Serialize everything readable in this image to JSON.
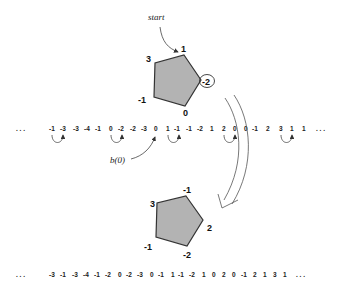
{
  "diagram": {
    "start_label": "start",
    "b0_label": "b(0)",
    "top_pentagon": {
      "vertices": [
        {
          "pos": "top",
          "value": "1"
        },
        {
          "pos": "right",
          "value": "-2",
          "circled": true
        },
        {
          "pos": "bottom-right",
          "value": "0"
        },
        {
          "pos": "bottom-left",
          "value": "-1"
        },
        {
          "pos": "upper-left",
          "value": "3"
        }
      ],
      "fill": "#b3b3b3",
      "stroke": "#333333"
    },
    "bottom_pentagon": {
      "vertices": [
        {
          "pos": "top",
          "value": "-1"
        },
        {
          "pos": "right",
          "value": "2"
        },
        {
          "pos": "bottom-right",
          "value": "-2"
        },
        {
          "pos": "bottom-left",
          "value": "-1"
        },
        {
          "pos": "upper-left",
          "value": "3"
        }
      ],
      "fill": "#b3b3b3",
      "stroke": "#333333"
    },
    "top_sequence": {
      "leading": ". . .",
      "values": [
        "-1",
        "-3",
        "-3",
        "-4",
        "-1",
        "0",
        "-2",
        "-2",
        "-3",
        "0",
        "1",
        "-1",
        "-1",
        "-2",
        "1",
        "2",
        "0",
        "0",
        "-1",
        "2",
        "3",
        "1",
        "1"
      ],
      "trailing": ". . .",
      "swap_pairs": [
        [
          0,
          1
        ],
        [
          5,
          6
        ],
        [
          10,
          11
        ],
        [
          15,
          16
        ],
        [
          20,
          21
        ]
      ]
    },
    "bottom_sequence": {
      "leading": ". . .",
      "values": [
        "-3",
        "-1",
        "-3",
        "-4",
        "-1",
        "-2",
        "0",
        "-2",
        "-3",
        "0",
        "-1",
        "1",
        "-1",
        "-2",
        "1",
        "0",
        "2",
        "0",
        "-1",
        "2",
        "1",
        "3",
        "1"
      ],
      "trailing": ". . ."
    }
  }
}
